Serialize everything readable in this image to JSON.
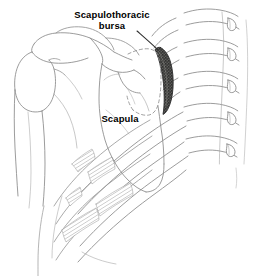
{
  "figure": {
    "view": "posterior view of right shoulder girdle and thoracic spine",
    "background_color": "#ffffff",
    "line_color": "#8a8a8a",
    "line_color_dark": "#5a5a5a",
    "label_color": "#000000",
    "width": 263,
    "height": 276
  },
  "labels": {
    "bursa": "Scapulothoracic\nbursa",
    "scapula": "Scapula"
  },
  "structures": [
    {
      "name": "scapulothoracic-bursa",
      "label": "Scapulothoracic bursa",
      "shading": "dark stipple",
      "color": "#3a3a3a"
    },
    {
      "name": "scapula",
      "label": "Scapula",
      "shading": "outline",
      "color": "#8a8a8a"
    },
    {
      "name": "humerus",
      "label": "Humerus",
      "shading": "outline",
      "color": "#8a8a8a"
    },
    {
      "name": "clavicle",
      "label": "Clavicle",
      "shading": "outline",
      "color": "#8a8a8a"
    },
    {
      "name": "ribs",
      "label": "Ribs",
      "shading": "outline with hatching",
      "color": "#8a8a8a"
    },
    {
      "name": "vertebrae",
      "label": "Thoracic vertebrae",
      "shading": "outline",
      "color": "#8a8a8a"
    }
  ],
  "leader_lines": [
    {
      "name": "bursa-leader-line",
      "from": "Scapulothoracic bursa label",
      "to": "bursa region"
    }
  ]
}
